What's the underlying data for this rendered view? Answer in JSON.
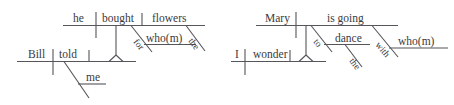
{
  "figure": {
    "kind": "reed-kellogg-sentence-diagrams",
    "background_color": "#ffffff",
    "line_color": "#55555a",
    "text_color": "#3a3a40"
  },
  "diagrams": [
    {
      "id": "left",
      "main_clause": {
        "subject": "Bill",
        "verb": "told",
        "indirect_object": "me"
      },
      "embedded_clause": {
        "subject": "he",
        "verb": "bought",
        "object": "flowers",
        "modifiers": [
          {
            "word": "for",
            "attaches_to": "bought"
          },
          {
            "word": "who(m)",
            "attaches_to": "for"
          },
          {
            "word": "the",
            "attaches_to": "flowers"
          }
        ]
      }
    },
    {
      "id": "right",
      "main_clause": {
        "subject": "I",
        "verb": "wonder"
      },
      "embedded_clause": {
        "subject": "Mary",
        "verb": "is going",
        "modifiers": [
          {
            "word": "to",
            "attaches_to": "is going"
          },
          {
            "word": "dance",
            "attaches_to": "to"
          },
          {
            "word": "the",
            "attaches_to": "dance"
          },
          {
            "word": "with",
            "attaches_to": "is going"
          },
          {
            "word": "who(m)",
            "attaches_to": "with"
          }
        ]
      }
    }
  ],
  "labels": {
    "l_he": "he",
    "l_bought": "bought",
    "l_flowers": "flowers",
    "l_for": "for",
    "l_whom1": "who(m)",
    "l_the1": "the",
    "l_bill": "Bill",
    "l_told": "told",
    "l_me": "me",
    "r_mary": "Mary",
    "r_isgoing": "is going",
    "r_to": "to",
    "r_dance": "dance",
    "r_the": "the",
    "r_with": "with",
    "r_whom": "who(m)",
    "r_i": "I",
    "r_wonder": "wonder"
  }
}
